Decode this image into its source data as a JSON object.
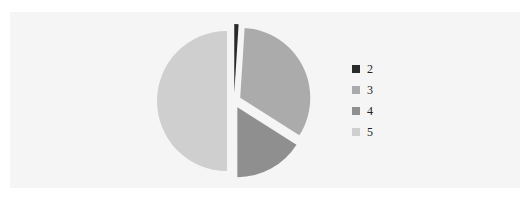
{
  "chart_data": {
    "type": "pie",
    "title": "",
    "exploded": true,
    "start_angle_deg": 0,
    "direction": "clockwise",
    "legend_position": "right",
    "categories": [
      "2",
      "3",
      "4",
      "5"
    ],
    "values": [
      1,
      33,
      16,
      50
    ],
    "colors": [
      "#2a2a2a",
      "#ababab",
      "#8f8f8f",
      "#cfcfcf"
    ]
  },
  "legend": {
    "items": [
      {
        "label": "2",
        "color": "#2a2a2a"
      },
      {
        "label": "3",
        "color": "#ababab"
      },
      {
        "label": "4",
        "color": "#8f8f8f"
      },
      {
        "label": "5",
        "color": "#cfcfcf"
      }
    ]
  }
}
